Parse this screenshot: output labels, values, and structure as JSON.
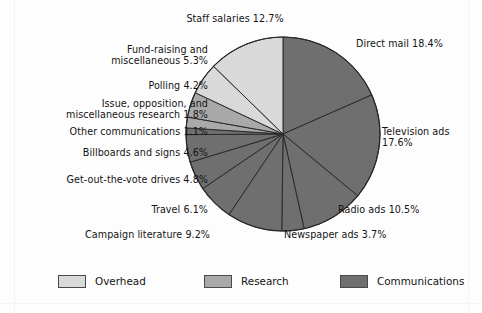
{
  "figure": {
    "background": "#fdfdfd"
  },
  "chart_data": {
    "type": "pie",
    "title": "",
    "legend_position": "bottom",
    "grid": false,
    "units": "percent",
    "total": 100.0,
    "start_angle_deg": -90,
    "direction": "clockwise",
    "categories": [
      "Direct mail",
      "Television ads",
      "Radio ads",
      "Newspaper ads",
      "Campaign literature",
      "Travel",
      "Get-out-the-vote drives",
      "Billboards and signs",
      "Other communications",
      "Issue, opposition, and miscellaneous research",
      "Polling",
      "Fund-raising and miscellaneous",
      "Staff salaries"
    ],
    "values": [
      18.4,
      17.6,
      10.5,
      3.7,
      9.2,
      6.1,
      4.8,
      4.6,
      1.1,
      1.8,
      4.2,
      5.3,
      12.7
    ],
    "slices": [
      {
        "name": "Direct mail",
        "value": 18.4,
        "group": "Communications",
        "color": "#6f6f6f"
      },
      {
        "name": "Television ads",
        "value": 17.6,
        "group": "Communications",
        "color": "#6f6f6f"
      },
      {
        "name": "Radio ads",
        "value": 10.5,
        "group": "Communications",
        "color": "#6f6f6f"
      },
      {
        "name": "Newspaper ads",
        "value": 3.7,
        "group": "Communications",
        "color": "#6f6f6f"
      },
      {
        "name": "Campaign literature",
        "value": 9.2,
        "group": "Communications",
        "color": "#6f6f6f"
      },
      {
        "name": "Travel",
        "value": 6.1,
        "group": "Communications",
        "color": "#6f6f6f"
      },
      {
        "name": "Get-out-the-vote drives",
        "value": 4.8,
        "group": "Communications",
        "color": "#6f6f6f"
      },
      {
        "name": "Billboards and signs",
        "value": 4.6,
        "group": "Communications",
        "color": "#6f6f6f"
      },
      {
        "name": "Other communications",
        "value": 1.1,
        "group": "Communications",
        "color": "#6f6f6f"
      },
      {
        "name": "Issue, opposition, and miscellaneous research",
        "value": 1.8,
        "group": "Research",
        "color": "#a9a9a9"
      },
      {
        "name": "Polling",
        "value": 4.2,
        "group": "Research",
        "color": "#a9a9a9"
      },
      {
        "name": "Fund-raising and miscellaneous",
        "value": 5.3,
        "group": "Overhead",
        "color": "#d9d9d9"
      },
      {
        "name": "Staff salaries",
        "value": 12.7,
        "group": "Overhead",
        "color": "#d9d9d9"
      }
    ],
    "legend": [
      {
        "label": "Overhead",
        "color": "#d9d9d9"
      },
      {
        "label": "Research",
        "color": "#a9a9a9"
      },
      {
        "label": "Communications",
        "color": "#6f6f6f"
      }
    ],
    "annotations": [
      "Staff salaries 12.7%",
      "Fund-raising and\nmiscellaneous 5.3%",
      "Polling 4.2%",
      "Issue, opposition, and\nmiscellaneous research 1.8%",
      "Other communications 1.1%",
      "Billboards and signs 4.6%",
      "Get-out-the-vote drives 4.8%",
      "Travel 6.1%",
      "Campaign literature 9.2%",
      "Newspaper ads 3.7%",
      "Radio ads 10.5%",
      "Television ads\n17.6%",
      "Direct mail 18.4%"
    ]
  },
  "labels": {
    "staff_salaries": "Staff salaries 12.7%",
    "fund_raising": "Fund-raising and\nmiscellaneous 5.3%",
    "polling": "Polling 4.2%",
    "issue_research": "Issue, opposition, and\nmiscellaneous research 1.8%",
    "other_communications": "Other communications 1.1%",
    "billboards": "Billboards and signs 4.6%",
    "gotv": "Get-out-the-vote drives 4.8%",
    "travel": "Travel 6.1%",
    "campaign_literature": "Campaign literature 9.2%",
    "newspaper_ads": "Newspaper ads 3.7%",
    "radio_ads": "Radio ads 10.5%",
    "television_ads": "Television ads\n17.6%",
    "direct_mail": "Direct mail 18.4%"
  },
  "legend": {
    "overhead": "Overhead",
    "research": "Research",
    "communications": "Communications"
  },
  "colors": {
    "overhead": "#d9d9d9",
    "research": "#a9a9a9",
    "communications": "#6f6f6f",
    "slice_outline": "#2a2a2a",
    "text": "#141414"
  }
}
